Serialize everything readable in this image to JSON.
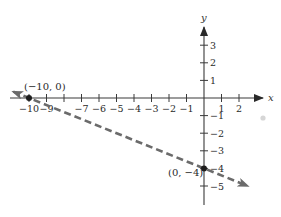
{
  "chart_data": {
    "type": "line",
    "title": "",
    "xlabel": "x",
    "ylabel": "y",
    "xlim": [
      -10.5,
      2.8
    ],
    "ylim": [
      -5.8,
      4.0
    ],
    "grid": false,
    "legend": null,
    "x_ticks": [
      -10,
      -9,
      -8,
      -7,
      -6,
      -5,
      -4,
      -3,
      -2,
      -1,
      1,
      2
    ],
    "x_tick_labels": [
      "−10",
      "−9",
      "",
      "−7",
      "−6",
      "−5",
      "−4",
      "−3",
      "−2",
      "−1",
      "1",
      "2"
    ],
    "y_ticks": [
      3,
      2,
      1,
      -1,
      -2,
      -3,
      -4,
      -5
    ],
    "y_tick_labels": [
      "3",
      "2",
      "1",
      "−1",
      "−2",
      "−3",
      "−4",
      "−5"
    ],
    "series": [
      {
        "name": "line",
        "style": "dashed",
        "color": "#6b6b6b",
        "equation": "y = -0.4x - 4",
        "x": [
          -10.9,
          2.5
        ],
        "y": [
          0.36,
          -5.0
        ]
      }
    ],
    "points": [
      {
        "x": -10,
        "y": 0,
        "label": "(−10, 0)"
      },
      {
        "x": 0,
        "y": -4,
        "label": "(0, −4)"
      }
    ]
  },
  "labels": {
    "x_axis": "x",
    "y_axis": "y",
    "point_a": "(−10, 0)",
    "point_b": "(0, −4)"
  },
  "colors": {
    "axis": "#3a3a3a",
    "line": "#6b6b6b",
    "point": "#1e1e1e"
  }
}
